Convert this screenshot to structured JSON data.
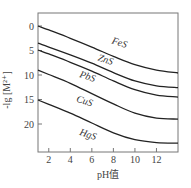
{
  "chart_data": {
    "type": "line",
    "title": "",
    "xlabel": "pH值",
    "ylabel": "-lg [M²⁺]",
    "x_ticks": [
      2,
      4,
      6,
      8,
      10,
      12
    ],
    "y_ticks": [
      0,
      5,
      10,
      15,
      20
    ],
    "xlim": [
      1,
      14
    ],
    "ylim": [
      0,
      26
    ],
    "y_inverted": true,
    "grid": false,
    "legend": "inline curve labels",
    "x": [
      1,
      2,
      4,
      6,
      8,
      10,
      12,
      14
    ],
    "series": [
      {
        "name": "FeS",
        "values": [
          0.0,
          0.8,
          2.5,
          4.3,
          6.2,
          7.9,
          9.0,
          9.6
        ],
        "label_pos": {
          "x": 7.8,
          "y": 3.5
        }
      },
      {
        "name": "ZnS",
        "values": [
          3.5,
          4.3,
          5.9,
          7.6,
          9.5,
          11.2,
          12.2,
          12.6
        ],
        "label_pos": {
          "x": 6.5,
          "y": 7.0
        }
      },
      {
        "name": "PbS",
        "values": [
          4.9,
          5.7,
          7.4,
          9.2,
          11.2,
          13.0,
          14.1,
          14.5
        ],
        "label_pos": {
          "x": 4.8,
          "y": 10.4
        }
      },
      {
        "name": "CuS",
        "values": [
          9.0,
          9.9,
          11.7,
          13.8,
          15.9,
          17.8,
          18.8,
          19.0
        ],
        "label_pos": {
          "x": 4.5,
          "y": 15.4
        }
      },
      {
        "name": "HgS",
        "values": [
          15.1,
          16.0,
          17.8,
          19.8,
          21.8,
          23.2,
          23.8,
          23.9
        ],
        "label_pos": {
          "x": 4.8,
          "y": 22.2
        }
      }
    ]
  },
  "labels": {
    "xlabel": "pH值",
    "ylabel": "-lg [M²⁺]"
  }
}
